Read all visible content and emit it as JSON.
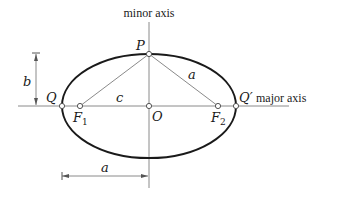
{
  "diagram": {
    "colors": {
      "ellipse": "#1a1a1a",
      "axes": "#8a8a8a",
      "lines": "#8a8a8a",
      "text": "#1a1a1a",
      "point_fill": "#ffffff",
      "point_stroke": "#555555"
    },
    "axis_labels": {
      "minor": "minor axis",
      "major": "major axis"
    },
    "points": {
      "P": "P",
      "Q": "Q",
      "Q_prime": "Q′",
      "O": "O",
      "F1": "F",
      "F1_sub": "1",
      "F2": "F",
      "F2_sub": "2"
    },
    "segment_labels": {
      "b": "b",
      "c": "c",
      "a_slant": "a",
      "a_dimension": "a"
    }
  }
}
